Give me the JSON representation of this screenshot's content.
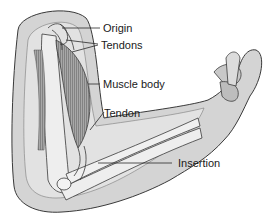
{
  "diagram": {
    "labels": {
      "origin": "Origin",
      "tendons": "Tendons",
      "muscle_body": "Muscle body",
      "tendon": "Tendon",
      "insertion": "Insertion"
    },
    "colors": {
      "skin": "#d6d6d6",
      "skin_light": "#e4e4e4",
      "outline": "#3a3a3a",
      "muscle": "#9a9a9a",
      "bone": "#eeeeee",
      "text": "#1a1a1a"
    }
  }
}
